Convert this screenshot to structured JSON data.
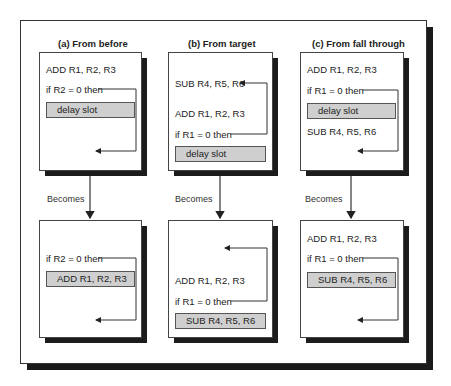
{
  "panels": [
    {
      "title": "(a)  From before",
      "before": {
        "instr1": "ADD R1, R2, R3",
        "branch": "if R2 = 0 then",
        "slot": "delay slot"
      },
      "becomes_label": "Becomes",
      "after": {
        "branch": "if R2 = 0 then",
        "slot": "ADD R1, R2, R3"
      }
    },
    {
      "title": "(b)  From target",
      "before": {
        "target": "SUB R4, R5, R6",
        "instr1": "ADD R1, R2, R3",
        "branch": "if R1 = 0 then",
        "slot": "delay slot"
      },
      "becomes_label": "Becomes",
      "after": {
        "instr1": "ADD R1, R2, R3",
        "branch": "if R1 = 0 then",
        "slot": "SUB R4, R5, R6"
      }
    },
    {
      "title": "(c)  From fall through",
      "before": {
        "instr1": "ADD R1, R2, R3",
        "branch": "if R1 = 0 then",
        "slot": "delay slot",
        "fallthrough": "SUB R4, R5, R6"
      },
      "becomes_label": "Becomes",
      "after": {
        "instr1": "ADD R1, R2, R3",
        "branch": "if R1 = 0 then",
        "slot": "SUB R4, R5, R6"
      }
    }
  ],
  "colors": {
    "slot_fill": "#cfcfcf",
    "shadow": "#1a1a1a",
    "line": "#333333"
  }
}
